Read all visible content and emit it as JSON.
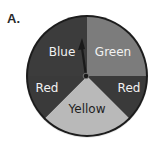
{
  "label": "A.",
  "spinner": {
    "center": [
      87,
      76
    ],
    "radius": 59,
    "pointer_direction": "up",
    "sections": [
      {
        "name": "Blue",
        "color": "#3c3c3c",
        "text_color": "#f2f2f2",
        "start_deg": 180,
        "end_deg": 270
      },
      {
        "name": "Green",
        "color": "#7c7c7c",
        "text_color": "#f2f2f2",
        "start_deg": 270,
        "end_deg": 360
      },
      {
        "name": "Red",
        "color": "#3a3a3a",
        "text_color": "#f2f2f2",
        "start_deg": 0,
        "end_deg": 45
      },
      {
        "name": "Yellow",
        "color": "#b9b9b9",
        "text_color": "#1e1e1e",
        "start_deg": 45,
        "end_deg": 135
      },
      {
        "name": "Red",
        "color": "#3a3a3a",
        "text_color": "#f2f2f2",
        "start_deg": 135,
        "end_deg": 180
      }
    ]
  }
}
